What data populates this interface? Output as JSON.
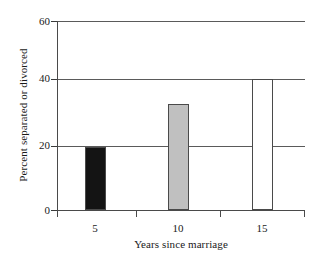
{
  "chart_data": {
    "type": "bar",
    "title": "",
    "subtitle": "",
    "xlabel": "Years since marriage",
    "ylabel": "Percent separated or divorced",
    "categories": [
      "5",
      "10",
      "15"
    ],
    "values": [
      20,
      33.5,
      41.5
    ],
    "series": [
      {
        "name": "Percent separated or divorced",
        "values": [
          20,
          33.5,
          41.5
        ]
      }
    ],
    "bar_fills": [
      "#141414",
      "#c0c0c0",
      "#ffffff"
    ],
    "bar_edge_color": "#4a4a4a",
    "xlim": [
      2.5,
      17.5
    ],
    "ylim": [
      0,
      60
    ],
    "y_ticks": [
      "0",
      "20",
      "40",
      "60"
    ],
    "y_tick_values": [
      0,
      20,
      40,
      60
    ],
    "x_ticks": [
      "5",
      "10",
      "15"
    ],
    "x_tick_values": [
      5,
      10,
      15
    ],
    "grid": "horizontal",
    "gridline_values": [
      20,
      40,
      60
    ],
    "legend": "none",
    "legend_position": "none",
    "annotations": []
  },
  "axes": {
    "y_title": "Percent separated or divorced",
    "x_title": "Years since marriage",
    "y_labels": {
      "t0": "0",
      "t1": "20",
      "t2": "40",
      "t3": "60"
    },
    "x_labels": {
      "t0": "5",
      "t1": "10",
      "t2": "15"
    }
  }
}
